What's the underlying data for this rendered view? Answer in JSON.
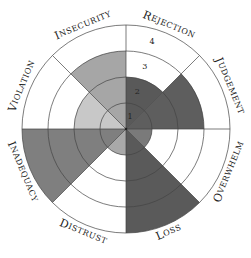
{
  "chart_data": {
    "type": "radial-bar",
    "title": "",
    "levels": [
      1,
      2,
      3,
      4
    ],
    "categories": [
      "Rejection",
      "Judgement",
      "Overwhelm",
      "Loss",
      "Distrust",
      "Inadequacy",
      "Violation",
      "Insecurity"
    ],
    "values": [
      2,
      3,
      1,
      4,
      1,
      4,
      2,
      3
    ],
    "colors": [
      "#595959",
      "#5e5e5e",
      "#7a7a7a",
      "#5a5a5a",
      "#a9a9a9",
      "#7f7f7f",
      "#c8c8c8",
      "#a6a6a6"
    ],
    "level_labels": [
      "1",
      "2",
      "3",
      "4"
    ],
    "grid": true,
    "legend": "none"
  },
  "center": {
    "x": 126,
    "y": 129
  },
  "ring_radius": 26,
  "label_radius": 112
}
